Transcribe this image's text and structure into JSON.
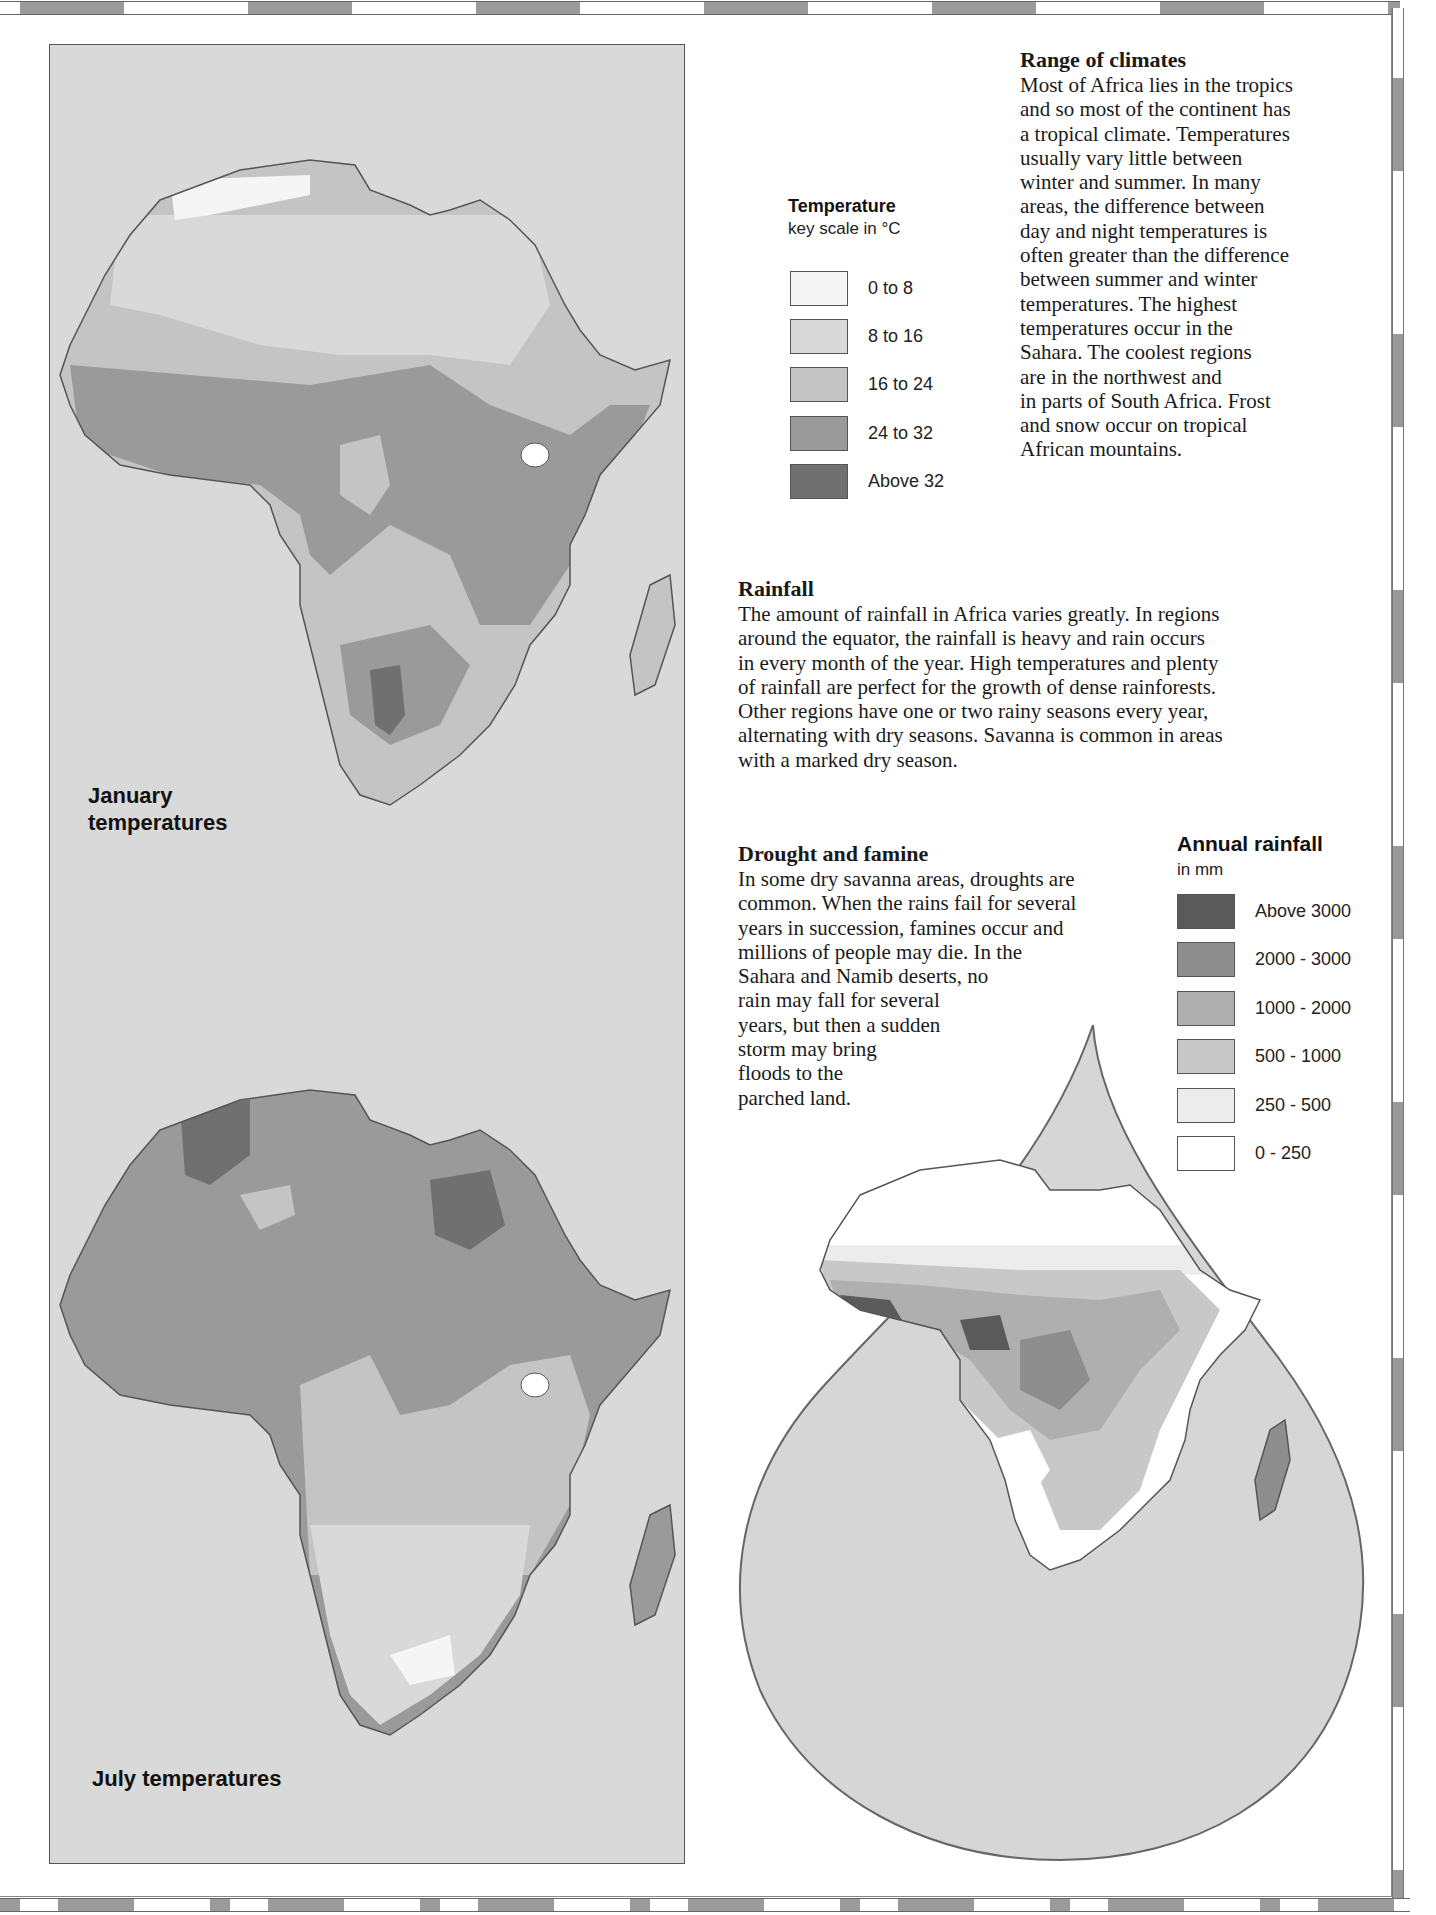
{
  "maps": {
    "january": {
      "label_line1": "January",
      "label_line2": "temperatures"
    },
    "july": {
      "label": "July temperatures"
    },
    "rainfall": {
      "label": "Annual rainfall map (drop-shaped)"
    }
  },
  "temperature_legend": {
    "title": "Temperature",
    "subtitle": "key scale in °C",
    "items": [
      {
        "label": "0 to 8",
        "color": "#f5f5f5"
      },
      {
        "label": "8 to 16",
        "color": "#d9d9d9"
      },
      {
        "label": "16 to 24",
        "color": "#c4c4c4"
      },
      {
        "label": "24 to 32",
        "color": "#9a9a9a"
      },
      {
        "label": "Above 32",
        "color": "#707070"
      }
    ]
  },
  "rainfall_legend": {
    "title": "Annual rainfall",
    "subtitle": "in mm",
    "items": [
      {
        "label": "Above 3000",
        "color": "#5a5a5a"
      },
      {
        "label": "2000 - 3000",
        "color": "#8e8e8e"
      },
      {
        "label": "1000 - 2000",
        "color": "#afafaf"
      },
      {
        "label": "500 - 1000",
        "color": "#c8c8c8"
      },
      {
        "label": "250 - 500",
        "color": "#ececec"
      },
      {
        "label": "0 - 250",
        "color": "#ffffff"
      }
    ]
  },
  "sections": {
    "range_of_climates": {
      "heading": "Range of climates",
      "lines": [
        "Most of Africa lies in the tropics",
        "and so most of the continent has",
        "a tropical climate. Temperatures",
        "usually vary little between",
        "winter and summer. In many",
        "areas, the difference between",
        "day and night temperatures is",
        "often greater than the difference",
        "between summer and winter",
        "temperatures. The highest",
        "temperatures occur in the",
        "Sahara. The coolest regions",
        "are in the northwest and",
        "in parts of South Africa. Frost",
        "and snow occur on tropical",
        "African mountains."
      ]
    },
    "rainfall": {
      "heading": "Rainfall",
      "lines": [
        "The amount of rainfall in Africa varies greatly. In regions",
        "around the equator, the rainfall is heavy and rain occurs",
        "in every month of the year. High temperatures and plenty",
        "of rainfall are perfect for the growth of dense rainforests.",
        "Other regions have one or two rainy seasons every year,",
        "alternating with dry seasons. Savanna is common in areas",
        "with a marked dry season."
      ]
    },
    "drought_and_famine": {
      "heading": "Drought and famine",
      "lines": [
        "In some dry savanna areas, droughts are",
        "common. When the rains fail for several",
        "years in succession, famines occur and",
        "millions of people may die. In the",
        "Sahara and Namib deserts, no",
        "rain may fall for several",
        "years, but then a sudden",
        "storm may bring",
        "floods to the",
        "parched land."
      ]
    }
  }
}
